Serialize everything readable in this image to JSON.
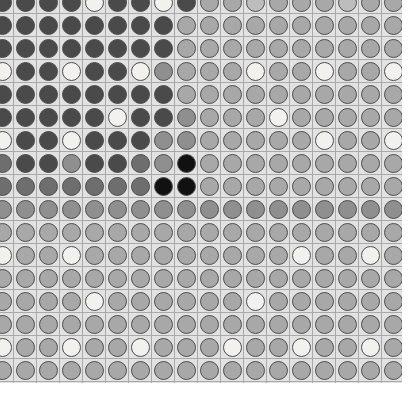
{
  "figure": {
    "kind": "circle-grid-heatmap",
    "background_color": "#ffffff",
    "cell_background_color": "#e2e2e2",
    "grid_line_color": "#a9a9a9",
    "dot_stroke_color": "#4d4d4d",
    "cell_size_px": 23,
    "dot_diameter_px": 19,
    "grid_left_px": -10,
    "grid_top_px": -10,
    "columns": 18,
    "rows": 18,
    "palette": {
      "black": "#111111",
      "dark": "#4a4a4a",
      "mid_dark": "#6e6e6e",
      "mid": "#8f8f8f",
      "mid_light": "#a8a8a8",
      "light": "#c6c6c6",
      "very_light": "#e4e4e4",
      "white": "#f4f4f2"
    }
  },
  "chart_data": {
    "type": "heatmap",
    "title": "",
    "subtitle": "",
    "xlabel": "",
    "ylabel": "",
    "legend": [],
    "annotations": [],
    "grid": true,
    "marker": "circle",
    "value_scale": {
      "min": 0,
      "max": 7,
      "description": "0 = black (lowest), 7 = white (highest)"
    },
    "x": [
      1,
      2,
      3,
      4,
      5,
      6,
      7,
      8,
      9,
      10,
      11,
      12,
      13,
      14,
      15,
      16,
      17,
      18
    ],
    "y": [
      1,
      2,
      3,
      4,
      5,
      6,
      7,
      8,
      9,
      10,
      11,
      12,
      13,
      14,
      15,
      16,
      17,
      18
    ],
    "values": [
      [
        1,
        1,
        1,
        1,
        7,
        1,
        1,
        7,
        1,
        4,
        4,
        5,
        4,
        4,
        4,
        5,
        4,
        4
      ],
      [
        1,
        1,
        1,
        1,
        1,
        1,
        1,
        1,
        4,
        4,
        4,
        4,
        4,
        4,
        4,
        4,
        4,
        4
      ],
      [
        1,
        1,
        1,
        1,
        1,
        1,
        1,
        1,
        4,
        4,
        4,
        4,
        4,
        4,
        4,
        4,
        4,
        4
      ],
      [
        7,
        1,
        1,
        7,
        1,
        1,
        7,
        3,
        4,
        4,
        4,
        7,
        4,
        4,
        7,
        4,
        4,
        7
      ],
      [
        1,
        1,
        1,
        1,
        1,
        1,
        1,
        1,
        4,
        4,
        4,
        4,
        4,
        4,
        4,
        4,
        4,
        4
      ],
      [
        1,
        1,
        1,
        1,
        1,
        7,
        1,
        1,
        3,
        4,
        4,
        4,
        7,
        4,
        4,
        4,
        4,
        4
      ],
      [
        7,
        1,
        1,
        7,
        1,
        1,
        1,
        3,
        3,
        4,
        4,
        4,
        4,
        4,
        7,
        4,
        4,
        7
      ],
      [
        2,
        1,
        1,
        3,
        1,
        1,
        2,
        3,
        0,
        4,
        4,
        4,
        4,
        4,
        4,
        4,
        4,
        4
      ],
      [
        2,
        2,
        2,
        2,
        2,
        2,
        2,
        0,
        0,
        4,
        4,
        4,
        4,
        4,
        4,
        4,
        4,
        4
      ],
      [
        3,
        3,
        3,
        3,
        3,
        3,
        3,
        3,
        3,
        3,
        3,
        3,
        3,
        3,
        3,
        3,
        3,
        3
      ],
      [
        4,
        4,
        4,
        4,
        4,
        4,
        4,
        4,
        4,
        4,
        4,
        4,
        4,
        4,
        4,
        4,
        4,
        4
      ],
      [
        7,
        4,
        4,
        7,
        4,
        4,
        4,
        4,
        4,
        4,
        4,
        4,
        4,
        7,
        4,
        4,
        7,
        4
      ],
      [
        4,
        4,
        4,
        4,
        4,
        4,
        4,
        4,
        4,
        4,
        4,
        4,
        4,
        4,
        4,
        4,
        4,
        4
      ],
      [
        4,
        4,
        4,
        4,
        7,
        4,
        4,
        4,
        4,
        4,
        4,
        7,
        4,
        4,
        4,
        4,
        4,
        4
      ],
      [
        4,
        4,
        4,
        4,
        4,
        4,
        4,
        4,
        4,
        4,
        4,
        4,
        4,
        4,
        4,
        4,
        4,
        4
      ],
      [
        7,
        4,
        4,
        7,
        4,
        4,
        7,
        4,
        4,
        4,
        7,
        4,
        4,
        7,
        4,
        4,
        7,
        4
      ],
      [
        4,
        4,
        4,
        4,
        4,
        4,
        4,
        4,
        4,
        4,
        4,
        4,
        4,
        4,
        4,
        4,
        4,
        4
      ],
      [
        4,
        4,
        4,
        4,
        4,
        4,
        4,
        4,
        4,
        4,
        4,
        4,
        4,
        4,
        4,
        4,
        4,
        4
      ]
    ],
    "value_color_map": [
      "#111111",
      "#4a4a4a",
      "#6e6e6e",
      "#8f8f8f",
      "#a8a8a8",
      "#bdbdbd",
      "#d6d6d6",
      "#f2f1ee"
    ],
    "notable_features": [
      "Dark cluster occupies the upper-left quadrant (columns 1-8, rows 1-9)",
      "Two pure black circles near center at approximately column 8-9, rows 8-9",
      "Remainder of the grid is a uniform medium-light gray",
      "Scattered near-white circles form a sparse regular pattern across the field",
      "Outer row and column are clipped by the image border"
    ]
  }
}
